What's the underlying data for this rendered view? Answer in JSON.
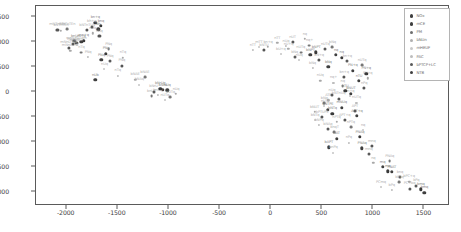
{
  "chart_data": {
    "type": "scatter",
    "title": "",
    "xlabel": "",
    "ylabel": "",
    "xlim": [
      -2300,
      1750
    ],
    "ylim": [
      -2280,
      1720
    ],
    "grid": false,
    "legend_position": "upper right",
    "xticks": [
      -2000,
      -1500,
      -1000,
      -500,
      0,
      500,
      1000,
      1500
    ],
    "xtick_labels": [
      "-2000",
      "-1500",
      "-1000",
      "-500",
      "0",
      "500",
      "1000",
      "1500"
    ],
    "yticks": [
      1500,
      1000,
      500,
      0,
      -500,
      -1000,
      -1500,
      -2000
    ],
    "ytick_labels": [
      "1500",
      "1000",
      "500",
      "0",
      "-500",
      "-1000",
      "-1500",
      "-2000"
    ],
    "legend": [
      {
        "label": "NOx",
        "color": "#3f3f3f",
        "size": 3.4
      },
      {
        "label": "mCE",
        "color": "#3f3f3f",
        "size": 3.2
      },
      {
        "label": "PM",
        "color": "#6e6e6e",
        "size": 2.8
      },
      {
        "label": "bNUn",
        "color": "#b0b0b0",
        "size": 2.4
      },
      {
        "label": "mHEUF",
        "color": "#c8c8c8",
        "size": 2.0
      },
      {
        "label": "PAC",
        "color": "#bdbdbd",
        "size": 2.2
      },
      {
        "label": "bPTCP+LC",
        "color": "#5a5a5a",
        "size": 3.0
      },
      {
        "label": "NTB",
        "color": "#3f3f3f",
        "size": 3.4
      }
    ],
    "series": [
      {
        "name": "NOx",
        "color": "#3f3f3f",
        "points": [
          {
            "x": -1720,
            "y": 1390,
            "label": "bn+q"
          },
          {
            "x": -1690,
            "y": 1255,
            "label": "bh"
          },
          {
            "x": -1855,
            "y": 1010,
            "label": "m+q"
          },
          {
            "x": -1925,
            "y": 1020,
            "label": "bnU"
          },
          {
            "x": -1660,
            "y": 640,
            "label": "PNq"
          },
          {
            "x": -1720,
            "y": 245,
            "label": "nUb"
          },
          {
            "x": -1060,
            "y": 45,
            "label": "bNrU"
          },
          {
            "x": -1015,
            "y": 35,
            "label": "nUq"
          },
          {
            "x": 385,
            "y": 740,
            "label": "bNPT"
          },
          {
            "x": 635,
            "y": 745,
            "label": "nq"
          },
          {
            "x": 560,
            "y": 500,
            "label": "bNq"
          },
          {
            "x": 800,
            "y": 430,
            "label": "PN+q"
          },
          {
            "x": 860,
            "y": 225,
            "label": "nTU"
          },
          {
            "x": 780,
            "y": -30,
            "label": "bNUT"
          },
          {
            "x": 690,
            "y": -310,
            "label": "mNUq"
          },
          {
            "x": 555,
            "y": -350,
            "label": "bNTPE"
          },
          {
            "x": 840,
            "y": -480,
            "label": "APT+q"
          },
          {
            "x": 640,
            "y": -930,
            "label": "NAT"
          },
          {
            "x": 565,
            "y": -1105,
            "label": "bAPT"
          },
          {
            "x": 890,
            "y": -1125,
            "label": "PNAq"
          },
          {
            "x": 1090,
            "y": -1500,
            "label": "mq"
          },
          {
            "x": 1180,
            "y": -1600,
            "label": "PNAT"
          },
          {
            "x": 1500,
            "y": -2010,
            "label": "bmq"
          }
        ]
      },
      {
        "name": "mCE",
        "color": "#555555",
        "points": [
          {
            "x": -1800,
            "y": 1245,
            "label": "bNTnTUq"
          },
          {
            "x": -2090,
            "y": 1250,
            "label": "mNTnTEn"
          },
          {
            "x": -1680,
            "y": 1120,
            "label": "nUq"
          },
          {
            "x": -1905,
            "y": 985,
            "label": "mn+nUTqm"
          },
          {
            "x": -1980,
            "y": 890,
            "label": "mNnUTnE"
          },
          {
            "x": -1460,
            "y": 530,
            "label": "PNq"
          },
          {
            "x": -70,
            "y": 835,
            "label": "bNTU"
          },
          {
            "x": 210,
            "y": 995,
            "label": "nUT"
          },
          {
            "x": 470,
            "y": 640,
            "label": "bN+q"
          },
          {
            "x": 715,
            "y": 300,
            "label": "bn+q"
          },
          {
            "x": 910,
            "y": 80,
            "label": "nPq"
          },
          {
            "x": 660,
            "y": -130,
            "label": "bNTnUq"
          },
          {
            "x": 500,
            "y": -505,
            "label": "bPTUPE"
          },
          {
            "x": 720,
            "y": -560,
            "label": "APT+q"
          },
          {
            "x": 985,
            "y": -1085,
            "label": "mnq"
          },
          {
            "x": 1260,
            "y": -1705,
            "label": "bnq"
          },
          {
            "x": 1355,
            "y": -1930,
            "label": "PC+bq"
          }
        ]
      },
      {
        "name": "PM",
        "color": "#767676",
        "points": [
          {
            "x": -1995,
            "y": 1265,
            "label": "mNTnTEn"
          },
          {
            "x": -1590,
            "y": 855,
            "label": "PNq"
          },
          {
            "x": -1855,
            "y": 790,
            "label": "nTq"
          },
          {
            "x": -1235,
            "y": 295,
            "label": "bNAE"
          },
          {
            "x": -1170,
            "y": -85,
            "label": "bnUT"
          },
          {
            "x": -985,
            "y": -105,
            "label": "nUTq"
          },
          {
            "x": 375,
            "y": 930,
            "label": "nq+"
          },
          {
            "x": 290,
            "y": 790,
            "label": "nUTq"
          },
          {
            "x": 600,
            "y": 905,
            "label": "bNq"
          },
          {
            "x": 890,
            "y": 540,
            "label": "nUTq"
          },
          {
            "x": 700,
            "y": 125,
            "label": "nq"
          },
          {
            "x": 520,
            "y": -215,
            "label": "bNq"
          },
          {
            "x": 780,
            "y": -705,
            "label": "nPTq"
          },
          {
            "x": 620,
            "y": -800,
            "label": "bnqT"
          },
          {
            "x": 1160,
            "y": -1385,
            "label": "PNAq"
          },
          {
            "x": 1255,
            "y": -1805,
            "label": "bPTq"
          }
        ]
      },
      {
        "name": "bNUn",
        "color": "#a8a8a8",
        "points": [
          {
            "x": -2055,
            "y": 1230,
            "label": "bNTnTEn"
          },
          {
            "x": -1745,
            "y": 1175,
            "label": "nUq"
          },
          {
            "x": -1965,
            "y": 830,
            "label": "mNnUTnE"
          },
          {
            "x": -1450,
            "y": 690,
            "label": "nTq"
          },
          {
            "x": -1330,
            "y": 250,
            "label": "bNAE"
          },
          {
            "x": -930,
            "y": -35,
            "label": "nUq"
          },
          {
            "x": 60,
            "y": 985,
            "label": "nTT"
          },
          {
            "x": -30,
            "y": 905,
            "label": "bn+q"
          },
          {
            "x": 170,
            "y": 865,
            "label": "nU+q"
          },
          {
            "x": 330,
            "y": 1060,
            "label": "nq"
          },
          {
            "x": 480,
            "y": 230,
            "label": "nUq"
          },
          {
            "x": 945,
            "y": 275,
            "label": "PN+q"
          },
          {
            "x": 560,
            "y": -165,
            "label": "ATE"
          },
          {
            "x": 425,
            "y": -400,
            "label": "bNUT"
          },
          {
            "x": 640,
            "y": -600,
            "label": "nPTq"
          },
          {
            "x": 1000,
            "y": -1420,
            "label": "nq"
          },
          {
            "x": 1350,
            "y": -1790,
            "label": "bPC+q"
          }
        ]
      },
      {
        "name": "mHEUF",
        "color": "#c4c4c4",
        "points": [
          {
            "x": -1900,
            "y": 935,
            "label": "mNnUTq"
          },
          {
            "x": -1630,
            "y": 460,
            "label": "nUq"
          },
          {
            "x": -1290,
            "y": 150,
            "label": "bNAq"
          },
          {
            "x": -1040,
            "y": -155,
            "label": "nUTq"
          },
          {
            "x": -120,
            "y": 905,
            "label": "mTT"
          },
          {
            "x": 95,
            "y": 760,
            "label": "bU+q"
          },
          {
            "x": 275,
            "y": 640,
            "label": "nUq"
          },
          {
            "x": 770,
            "y": -85,
            "label": "bn+q"
          },
          {
            "x": 520,
            "y": -280,
            "label": "nUT"
          },
          {
            "x": 430,
            "y": -555,
            "label": "bNTq"
          },
          {
            "x": 900,
            "y": -760,
            "label": "nq"
          },
          {
            "x": 610,
            "y": -1210,
            "label": "bnPq"
          },
          {
            "x": 1075,
            "y": -1905,
            "label": "PCmq"
          }
        ]
      },
      {
        "name": "PAC",
        "color": "#bdbdbd",
        "points": [
          {
            "x": -1790,
            "y": 700,
            "label": "PNq"
          },
          {
            "x": -1500,
            "y": 330,
            "label": "nTq"
          },
          {
            "x": -1110,
            "y": -55,
            "label": "bnUq"
          },
          {
            "x": -180,
            "y": 840,
            "label": "nTT"
          },
          {
            "x": 145,
            "y": 925,
            "label": "nUq"
          },
          {
            "x": 405,
            "y": 480,
            "label": "bNq"
          },
          {
            "x": 610,
            "y": 190,
            "label": "nq+"
          },
          {
            "x": 835,
            "y": -210,
            "label": "nUTq"
          },
          {
            "x": 470,
            "y": -660,
            "label": "bNPq"
          },
          {
            "x": 760,
            "y": -1010,
            "label": "nPq"
          },
          {
            "x": 1180,
            "y": -1960,
            "label": "bPq"
          }
        ]
      },
      {
        "name": "bPTCP+LC",
        "color": "#5a5a5a",
        "points": [
          {
            "x": -1755,
            "y": 1310,
            "label": "bh+q"
          },
          {
            "x": -1935,
            "y": 960,
            "label": "mNnUq"
          },
          {
            "x": -1575,
            "y": 615,
            "label": "PNq"
          },
          {
            "x": -1150,
            "y": 10,
            "label": "bNrU"
          },
          {
            "x": 230,
            "y": 700,
            "label": "bNq"
          },
          {
            "x": 530,
            "y": 860,
            "label": "nUTq"
          },
          {
            "x": 745,
            "y": 615,
            "label": "bn+q"
          },
          {
            "x": 595,
            "y": -55,
            "label": "nUq"
          },
          {
            "x": 820,
            "y": -385,
            "label": "APT"
          },
          {
            "x": 555,
            "y": -745,
            "label": "bNAq"
          },
          {
            "x": 955,
            "y": -1245,
            "label": "mnq"
          },
          {
            "x": 1420,
            "y": -1870,
            "label": "bPq"
          }
        ]
      },
      {
        "name": "NTB",
        "color": "#3a3a3a",
        "points": [
          {
            "x": -1665,
            "y": 1320,
            "label": "bnq"
          },
          {
            "x": -1835,
            "y": 1030,
            "label": "mn+q"
          },
          {
            "x": -1615,
            "y": 770,
            "label": "PNq"
          },
          {
            "x": -1085,
            "y": 70,
            "label": "bNrUq"
          },
          {
            "x": 440,
            "y": 795,
            "label": "bNPT"
          },
          {
            "x": 690,
            "y": 690,
            "label": "nq"
          },
          {
            "x": 930,
            "y": 370,
            "label": "PN+q"
          },
          {
            "x": 725,
            "y": 20,
            "label": "nTU"
          },
          {
            "x": 600,
            "y": -430,
            "label": "bNTq"
          },
          {
            "x": 870,
            "y": -895,
            "label": "PNAq"
          },
          {
            "x": 1140,
            "y": -1585,
            "label": "mq"
          },
          {
            "x": 1465,
            "y": -1945,
            "label": "bmq"
          }
        ]
      }
    ]
  }
}
